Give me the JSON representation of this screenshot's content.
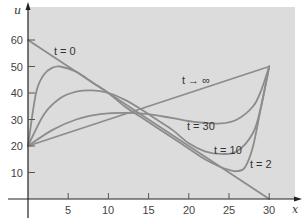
{
  "chart_data": {
    "type": "line",
    "title": "",
    "xlabel": "x",
    "ylabel": "u",
    "xlim": [
      0,
      30
    ],
    "ylim": [
      0,
      65
    ],
    "grid": false,
    "background": "#dcdcdc",
    "line_color": "#8a8a8a",
    "xticks": [
      5,
      10,
      15,
      20,
      25,
      30
    ],
    "yticks": [
      10,
      20,
      30,
      40,
      50,
      60
    ],
    "series": [
      {
        "name": "t = 0",
        "x": [
          0,
          30
        ],
        "y": [
          60,
          0
        ]
      },
      {
        "name": "t = 2",
        "x": [
          0,
          1,
          2,
          3,
          4,
          6,
          8,
          10,
          12,
          14,
          16,
          18,
          20,
          22,
          24,
          25,
          26,
          27,
          28,
          29,
          30
        ],
        "y": [
          20,
          40,
          47,
          49.5,
          50,
          48,
          44,
          40,
          35,
          31,
          27,
          23,
          19,
          15,
          12,
          11,
          10.5,
          12,
          20,
          35,
          50
        ]
      },
      {
        "name": "t = 10",
        "x": [
          0,
          2,
          4,
          6,
          8,
          10,
          12,
          14,
          16,
          18,
          20,
          22,
          24,
          26,
          28,
          29,
          30
        ],
        "y": [
          20,
          32,
          38,
          40.5,
          41,
          40,
          37.5,
          34,
          30,
          26,
          21,
          18,
          17,
          18,
          25,
          35,
          50
        ]
      },
      {
        "name": "t = 30",
        "x": [
          0,
          3,
          6,
          9,
          12,
          15,
          18,
          21,
          24,
          26,
          28,
          29,
          30
        ],
        "y": [
          20,
          26,
          30,
          32,
          32.5,
          32,
          30.5,
          29,
          28.5,
          30,
          35,
          41,
          50
        ]
      },
      {
        "name": "t → ∞",
        "x": [
          0,
          30
        ],
        "y": [
          20,
          50
        ]
      }
    ],
    "annotations": [
      {
        "text": "t = 0",
        "x": 6.5,
        "y": 54
      },
      {
        "text": "t → ∞",
        "x": 19,
        "y": 40
      },
      {
        "text": "t = 30",
        "x": 20,
        "y": 27
      },
      {
        "text": "t = 10",
        "x": 23,
        "y": 18
      },
      {
        "text": "t = 2",
        "x": 27.5,
        "y": 12
      }
    ]
  },
  "labels": {
    "x_axis": "x",
    "y_axis": "u",
    "xticks": [
      "5",
      "10",
      "15",
      "20",
      "25",
      "30"
    ],
    "yticks": [
      "10",
      "20",
      "30",
      "40",
      "50",
      "60"
    ],
    "ann_t0": "t = 0",
    "ann_tinf": "t → ∞",
    "ann_t30": "t = 30",
    "ann_t10": "t = 10",
    "ann_t2": "t = 2"
  }
}
